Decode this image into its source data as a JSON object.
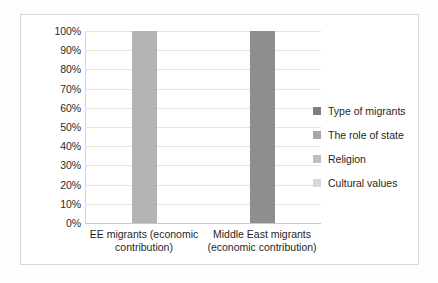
{
  "chart_data": {
    "type": "bar",
    "title": "",
    "subtitle": "",
    "xlabel": "",
    "ylabel": "",
    "ylim": [
      0,
      100
    ],
    "grid": true,
    "legend_position": "right",
    "stacked": true,
    "categories": [
      "EE migrants (economic contribution)",
      "Middle East migrants (economic contribution)"
    ],
    "category_lines": [
      [
        "EE migrants (economic",
        "contribution)"
      ],
      [
        "Middle East migrants",
        "(economic contribution)"
      ]
    ],
    "y_ticks": [
      "100%",
      "90%",
      "80%",
      "70%",
      "60%",
      "50%",
      "40%",
      "30%",
      "20%",
      "10%",
      "0%"
    ],
    "y_tick_values": [
      100,
      90,
      80,
      70,
      60,
      50,
      40,
      30,
      20,
      10,
      0
    ],
    "series": [
      {
        "name": "Type of migrants",
        "color": "#808080",
        "values": [
          0,
          0
        ]
      },
      {
        "name": "The role of state",
        "color": "#a6a6a6",
        "values": [
          0,
          0
        ]
      },
      {
        "name": "Religion",
        "color": "#bfbfbf",
        "values": [
          0,
          0
        ]
      },
      {
        "name": "Cultural values",
        "color": "#d9d9d9",
        "values": [
          0,
          0
        ]
      }
    ],
    "bars": [
      {
        "category": "EE migrants (economic contribution)",
        "value": 100,
        "color": "#b4b4b4"
      },
      {
        "category": "Middle East migrants (economic contribution)",
        "value": 100,
        "color": "#8e8e8e"
      }
    ],
    "legend": [
      {
        "label": "Type of migrants",
        "color": "#808080"
      },
      {
        "label": "The role of state",
        "color": "#a6a6a6"
      },
      {
        "label": "Religion",
        "color": "#bfbfbf"
      },
      {
        "label": "Cultural values",
        "color": "#d9d9d9"
      }
    ],
    "colors": {
      "gridline": "#e3e3e3",
      "axis": "#c9c9c9",
      "frame_border": "#d8d8d8",
      "plot_background": "#ffffff",
      "text": "#1f1f1f"
    }
  }
}
